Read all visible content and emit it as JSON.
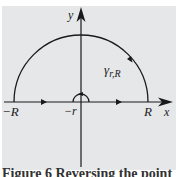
{
  "diagram": {
    "axes": {
      "x_label": "x",
      "y_label": "y"
    },
    "points": {
      "neg_R": "−R",
      "neg_r": "−r",
      "R": "R"
    },
    "contour_label": "γ",
    "contour_subscript": "r,R",
    "colors": {
      "background": "#e5e7e9",
      "stroke": "#1a1a1a"
    }
  },
  "caption": "Figure 6 Reversing the point"
}
